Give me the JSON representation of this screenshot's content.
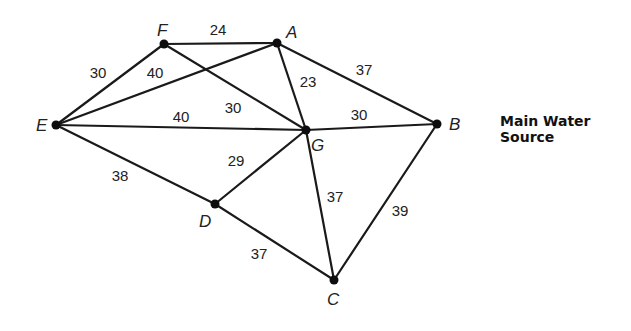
{
  "annotation": {
    "line1": "Main Water",
    "line2": "Source",
    "attached_to": "B"
  },
  "nodes": [
    {
      "id": "A",
      "x": 277,
      "y": 43,
      "label_x": 286,
      "label_y": 38,
      "italic": true
    },
    {
      "id": "B",
      "x": 437,
      "y": 124,
      "label_x": 449,
      "label_y": 130,
      "italic": true
    },
    {
      "id": "C",
      "x": 334,
      "y": 280,
      "label_x": 327,
      "label_y": 305,
      "italic": false
    },
    {
      "id": "D",
      "x": 215,
      "y": 204,
      "label_x": 199,
      "label_y": 227,
      "italic": true
    },
    {
      "id": "E",
      "x": 56,
      "y": 125,
      "label_x": 36,
      "label_y": 131,
      "italic": true
    },
    {
      "id": "F",
      "x": 164,
      "y": 44,
      "label_x": 157,
      "label_y": 36,
      "italic": true
    },
    {
      "id": "G",
      "x": 306,
      "y": 130,
      "label_x": 311,
      "label_y": 151,
      "italic": true
    }
  ],
  "edges": [
    {
      "from": "F",
      "to": "A",
      "weight": "24",
      "label_x": 218,
      "label_y": 35
    },
    {
      "from": "E",
      "to": "F",
      "weight": "30",
      "label_x": 98,
      "label_y": 78
    },
    {
      "from": "E",
      "to": "A",
      "weight": "40",
      "label_x": 155,
      "label_y": 78
    },
    {
      "from": "F",
      "to": "G",
      "weight": "30",
      "label_x": 233,
      "label_y": 113
    },
    {
      "from": "E",
      "to": "G",
      "weight": "40",
      "label_x": 181,
      "label_y": 122
    },
    {
      "from": "A",
      "to": "G",
      "weight": "23",
      "label_x": 308,
      "label_y": 87
    },
    {
      "from": "A",
      "to": "B",
      "weight": "37",
      "label_x": 364,
      "label_y": 75
    },
    {
      "from": "G",
      "to": "B",
      "weight": "30",
      "label_x": 359,
      "label_y": 120
    },
    {
      "from": "E",
      "to": "D",
      "weight": "38",
      "label_x": 120,
      "label_y": 181
    },
    {
      "from": "D",
      "to": "G",
      "weight": "29",
      "label_x": 236,
      "label_y": 166
    },
    {
      "from": "G",
      "to": "C",
      "weight": "37",
      "label_x": 335,
      "label_y": 202
    },
    {
      "from": "B",
      "to": "C",
      "weight": "39",
      "label_x": 400,
      "label_y": 216
    },
    {
      "from": "D",
      "to": "C",
      "weight": "37",
      "label_x": 259,
      "label_y": 259
    }
  ],
  "colors": {
    "edge": "#1a1a1a",
    "node": "#0d0d0d",
    "text": "#222222",
    "background": "#ffffff"
  }
}
